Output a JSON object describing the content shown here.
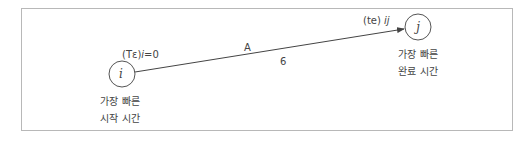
{
  "diagram": {
    "type": "activity-on-arrow network",
    "nodes": [
      {
        "id": "i",
        "label": "i",
        "top_label": "(Tε)i=0",
        "top_label_prefix": "(Tε)",
        "top_label_var": "i",
        "top_label_suffix": "=0",
        "caption_line1": "가장 빠른",
        "caption_line2": "시작 시간"
      },
      {
        "id": "j",
        "label": "j",
        "caption_line1": "가장 빠른",
        "caption_line2": "완료 시간"
      }
    ],
    "edge": {
      "from": "i",
      "to": "j",
      "activity": "A",
      "duration": "6",
      "end_label_prefix": "(te) ",
      "end_label_var": "ij"
    },
    "colors": {
      "line": "#444444",
      "frame": "#b8b8b8",
      "text": "#444444"
    }
  }
}
